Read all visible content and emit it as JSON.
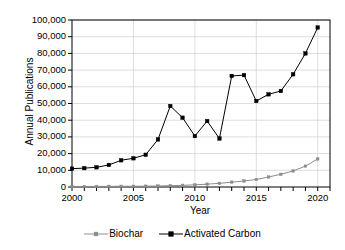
{
  "chart_data": {
    "type": "line",
    "title": "",
    "xlabel": "Year",
    "ylabel": "Annual Publications",
    "x": [
      2000,
      2001,
      2002,
      2003,
      2004,
      2005,
      2006,
      2007,
      2008,
      2009,
      2010,
      2011,
      2012,
      2013,
      2014,
      2015,
      2016,
      2017,
      2018,
      2019,
      2020
    ],
    "xlim": [
      2000,
      2021
    ],
    "ylim": [
      0,
      100000
    ],
    "ytick_values": [
      0,
      10000,
      20000,
      30000,
      40000,
      50000,
      60000,
      70000,
      80000,
      90000,
      100000
    ],
    "ytick_labels": [
      "0",
      "10,000",
      "20,000",
      "30,000",
      "40,000",
      "50,000",
      "60,000",
      "70,000",
      "80,000",
      "90,000",
      "100,000"
    ],
    "xtick_values": [
      2000,
      2005,
      2010,
      2015,
      2020
    ],
    "xtick_labels": [
      "2000",
      "2005",
      "2010",
      "2015",
      "2020"
    ],
    "grid": "horizontal-and-vertical",
    "legend_position": "bottom-center",
    "series": [
      {
        "name": "Biochar",
        "color": "#8c8c8c",
        "marker": "square",
        "values": [
          300,
          320,
          350,
          380,
          420,
          450,
          500,
          600,
          800,
          1000,
          1300,
          1700,
          2200,
          2900,
          3600,
          4500,
          6000,
          7600,
          9600,
          12500,
          16800
        ]
      },
      {
        "name": "Activated Carbon",
        "color": "#000000",
        "marker": "square",
        "values": [
          11000,
          11300,
          11800,
          13200,
          16000,
          17200,
          19300,
          28500,
          48500,
          41500,
          30500,
          39500,
          29000,
          66500,
          67000,
          51500,
          55500,
          57500,
          67500,
          80000,
          95500
        ]
      }
    ]
  },
  "legend": {
    "entries": [
      {
        "label": "Biochar"
      },
      {
        "label": "Activated Carbon"
      }
    ]
  }
}
